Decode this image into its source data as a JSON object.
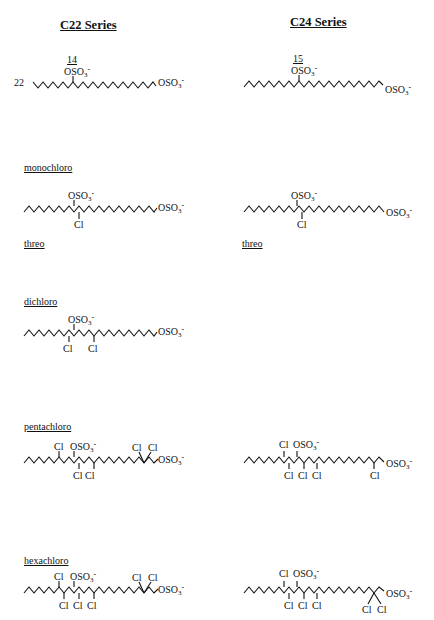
{
  "series": {
    "c22": {
      "title": "C22 Series"
    },
    "c24": {
      "title": "C24 Series"
    }
  },
  "labels": {
    "monochloro": "monochloro",
    "dichloro": "dichloro",
    "pentachloro": "pentachloro",
    "hexachloro": "hexachloro",
    "threo_c22": "threo",
    "threo_c24": "threo"
  },
  "atoms": {
    "osulfate": "OSO",
    "sub3": "3",
    "minus": "-",
    "cl": "Cl",
    "pos22": "22",
    "pos14": "14",
    "pos15": "15"
  },
  "structures": [
    {
      "id": "c22-parent",
      "series": "C22",
      "class": "parent",
      "substituents": [
        "22-position",
        "14-OSO3-",
        "terminal OSO3-"
      ]
    },
    {
      "id": "c24-parent",
      "series": "C24",
      "class": "parent",
      "substituents": [
        "15-OSO3-",
        "terminal OSO3-"
      ]
    },
    {
      "id": "c22-monochloro",
      "series": "C22",
      "class": "monochloro",
      "stereo": "threo",
      "substituents": [
        "OSO3-",
        "Cl",
        "terminal OSO3-"
      ]
    },
    {
      "id": "c24-monochloro",
      "series": "C24",
      "class": "monochloro",
      "stereo": "threo",
      "substituents": [
        "OSO3-",
        "Cl",
        "terminal OSO3-"
      ]
    },
    {
      "id": "c22-dichloro",
      "series": "C22",
      "class": "dichloro",
      "substituents": [
        "OSO3-",
        "Cl",
        "Cl",
        "terminal OSO3-"
      ]
    },
    {
      "id": "c22-pentachloro",
      "series": "C22",
      "class": "pentachloro",
      "substituents": [
        "Cl",
        "OSO3-",
        "Cl",
        "Cl",
        "Cl",
        "Cl",
        "terminal OSO3-"
      ]
    },
    {
      "id": "c24-pentachloro",
      "series": "C24",
      "class": "pentachloro",
      "substituents": [
        "Cl",
        "OSO3-",
        "Cl",
        "Cl",
        "Cl",
        "Cl",
        "terminal OSO3-"
      ]
    },
    {
      "id": "c22-hexachloro",
      "series": "C22",
      "class": "hexachloro",
      "substituents": [
        "Cl",
        "OSO3-",
        "Cl",
        "Cl",
        "Cl",
        "Cl",
        "Cl",
        "terminal OSO3-"
      ]
    },
    {
      "id": "c24-hexachloro",
      "series": "C24",
      "class": "hexachloro",
      "substituents": [
        "Cl",
        "OSO3-",
        "Cl",
        "Cl",
        "Cl",
        "Cl",
        "Cl",
        "terminal OSO3-"
      ]
    }
  ]
}
